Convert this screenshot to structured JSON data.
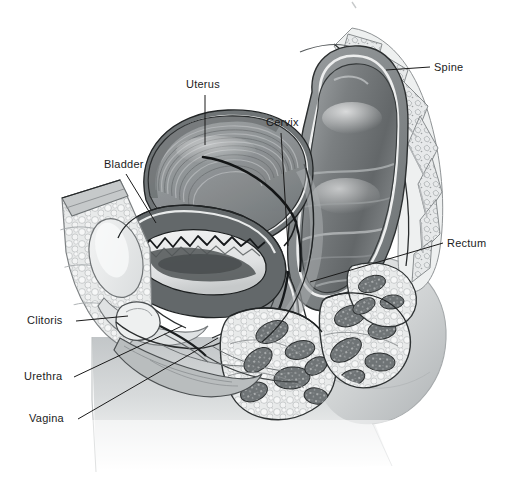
{
  "figure": {
    "kind": "anatomical-illustration",
    "style": "grayscale medical line-and-tone drawing",
    "background_color": "#ffffff",
    "label_color": "#1c1c1c",
    "leader_line_color": "#1a1a1a",
    "width": 510,
    "height": 481
  },
  "labels": {
    "uterus": "Uterus",
    "cervix": "Cervix",
    "bladder": "Bladder",
    "spine": "Spine",
    "rectum": "Rectum",
    "clitoris": "Clitoris",
    "urethra": "Urethra",
    "vagina": "Vagina"
  },
  "callouts": [
    {
      "id": "uterus",
      "text": "Uterus",
      "text_x": 186,
      "text_y": 90,
      "line": [
        [
          205,
          95
        ],
        [
          205,
          145
        ]
      ]
    },
    {
      "id": "cervix",
      "text": "Cervix",
      "text_x": 266,
      "text_y": 128,
      "line": [
        [
          281,
          133
        ],
        [
          288,
          246
        ]
      ]
    },
    {
      "id": "bladder",
      "text": "Bladder",
      "text_x": 104,
      "text_y": 170,
      "line": [
        [
          126,
          174
        ],
        [
          156,
          223
        ]
      ]
    },
    {
      "id": "spine",
      "text": "Spine",
      "text_x": 434,
      "text_y": 73,
      "line": [
        [
          430,
          67
        ],
        [
          386,
          70
        ]
      ]
    },
    {
      "id": "rectum",
      "text": "Rectum",
      "text_x": 447,
      "text_y": 249,
      "line": [
        [
          443,
          243
        ],
        [
          310,
          282
        ]
      ]
    },
    {
      "id": "clitoris",
      "text": "Clitoris",
      "text_x": 27,
      "text_y": 326,
      "line": [
        [
          76,
          321
        ],
        [
          122,
          316
        ]
      ]
    },
    {
      "id": "urethra",
      "text": "Urethra",
      "text_x": 24,
      "text_y": 382,
      "line": [
        [
          74,
          377
        ],
        [
          180,
          326
        ]
      ]
    },
    {
      "id": "vagina",
      "text": "Vagina",
      "text_x": 29,
      "text_y": 424,
      "line": [
        [
          78,
          419
        ],
        [
          214,
          338
        ]
      ]
    }
  ],
  "structures": [
    {
      "name": "uterus",
      "description": "anteverted uterine body with swirled myometrium and dark endometrial cavity line"
    },
    {
      "name": "cervix",
      "description": "cervical canal at lower uterine segment"
    },
    {
      "name": "bladder",
      "description": "urinary bladder with rugose mucosal lining, anterior to uterus"
    },
    {
      "name": "spine",
      "description": "stacked lumbar and sacral vertebrae curving posteriorly, pale cancellous bone"
    },
    {
      "name": "rectum",
      "description": "large dark rectal lumen anterior to sacrum"
    },
    {
      "name": "clitoris",
      "description": "clitoral body anterior-inferior to pubic symphysis"
    },
    {
      "name": "urethra",
      "description": "urethra running from bladder neck to external meatus"
    },
    {
      "name": "vagina",
      "description": "vaginal canal between urethra and rectum"
    },
    {
      "name": "pubic-bone",
      "description": "pubic symphysis cross-section, pale bone"
    },
    {
      "name": "subcutaneous-fat",
      "description": "bubbly adipose tissue of mons and abdominal wall"
    },
    {
      "name": "perineal-muscle",
      "description": "dark muscle bundle cross-sections in the perineum"
    },
    {
      "name": "body-silhouette",
      "description": "gray shaded thigh and buttock contour fading to white"
    }
  ],
  "palette": {
    "paper": "#ffffff",
    "ink": "#1a1a1a",
    "muscle_dark": "#555a5c",
    "muscle_mid": "#7d8284",
    "organ_dark": "#6c7072",
    "organ_mid": "#8d9193",
    "organ_light": "#b7babb",
    "fat_light": "#e4e6e6",
    "fat_shade": "#c9cccd",
    "bone_light": "#eceeee",
    "bone_mid": "#cfd2d3",
    "silhouette": "#c4c7c9",
    "silhouette_light": "#e3e5e6"
  }
}
